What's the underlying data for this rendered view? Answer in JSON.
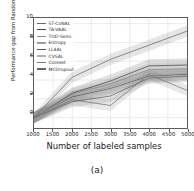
{
  "figure": {
    "caption": "(a)"
  },
  "chart_data": {
    "type": "line",
    "title": "",
    "xlabel": "Number of labeled samples",
    "ylabel": "Performance gap from Random sampling(%)",
    "xlim": [
      1000,
      5000
    ],
    "ylim": [
      -1.1,
      10.6
    ],
    "xticks": [
      1000,
      1500,
      2000,
      2500,
      3000,
      3500,
      4000,
      4500,
      5000
    ],
    "yticks": [
      0,
      2,
      4,
      6,
      8,
      10
    ],
    "xtick_labels": [
      "1000",
      "1500",
      "2000",
      "2500",
      "3000",
      "3500",
      "4000",
      "4500",
      "5000"
    ],
    "ytick_labels": [
      "0",
      "2",
      "4",
      "6",
      "8",
      "10"
    ],
    "grid": true,
    "legend_position": "upper left",
    "x": [
      1000,
      2000,
      3000,
      4000,
      5000
    ],
    "series": [
      {
        "name": "ST-CoNAL",
        "color": "#6b6b6b",
        "values": [
          0.0,
          4.3,
          6.2,
          7.7,
          9.2
        ],
        "band_low": [
          -0.5,
          3.7,
          5.6,
          7.1,
          8.6
        ],
        "band_high": [
          0.5,
          4.9,
          6.8,
          8.3,
          9.8
        ]
      },
      {
        "name": "TA-VAAL",
        "color": "#4a4a4a",
        "values": [
          0.0,
          2.6,
          3.9,
          5.5,
          5.6
        ],
        "band_low": [
          -0.6,
          2.0,
          3.2,
          4.8,
          4.9
        ],
        "band_high": [
          0.6,
          3.2,
          4.6,
          6.2,
          6.3
        ]
      },
      {
        "name": "TOD-Semi",
        "color": "#8a8a8a",
        "values": [
          0.0,
          2.5,
          3.6,
          5.1,
          5.2
        ],
        "band_low": [
          -0.6,
          1.9,
          3.0,
          4.4,
          4.5
        ],
        "band_high": [
          0.6,
          3.1,
          4.2,
          5.8,
          5.9
        ]
      },
      {
        "name": "Entropy",
        "color": "#9e9e9e",
        "values": [
          0.0,
          2.3,
          3.3,
          4.6,
          4.7
        ],
        "band_low": [
          -0.6,
          1.7,
          2.7,
          4.0,
          4.1
        ],
        "band_high": [
          0.6,
          2.9,
          3.9,
          5.2,
          5.3
        ]
      },
      {
        "name": "LL4AL",
        "color": "#5a5a5a",
        "values": [
          0.0,
          2.2,
          3.1,
          4.4,
          4.6
        ],
        "band_low": [
          -0.6,
          1.6,
          2.5,
          3.8,
          4.0
        ],
        "band_high": [
          0.6,
          2.8,
          3.7,
          5.0,
          5.2
        ]
      },
      {
        "name": "CVSAL",
        "color": "#b0b0b0",
        "values": [
          0.0,
          2.1,
          3.0,
          4.3,
          4.5
        ],
        "band_low": [
          -0.6,
          1.5,
          2.4,
          3.7,
          3.9
        ],
        "band_high": [
          0.6,
          2.7,
          3.6,
          4.9,
          5.1
        ]
      },
      {
        "name": "Coreset",
        "color": "#777777",
        "values": [
          0.0,
          1.9,
          1.3,
          4.6,
          2.9
        ],
        "band_low": [
          -0.6,
          1.3,
          0.7,
          4.0,
          2.3
        ],
        "band_high": [
          0.6,
          2.5,
          1.9,
          5.2,
          3.5
        ]
      },
      {
        "name": "MCDropout",
        "color": "#666666",
        "values": [
          0.0,
          1.7,
          2.3,
          4.2,
          4.4
        ],
        "band_low": [
          -0.6,
          1.1,
          1.7,
          3.6,
          3.8
        ],
        "band_high": [
          0.6,
          2.3,
          2.9,
          4.8,
          5.0
        ]
      }
    ]
  }
}
